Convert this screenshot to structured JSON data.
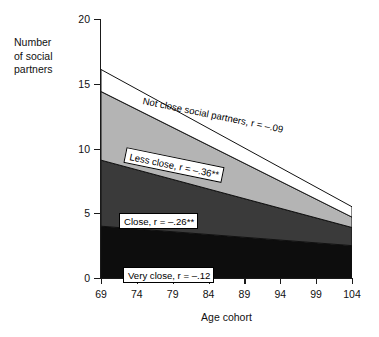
{
  "chart_data": {
    "type": "area",
    "title": "",
    "xlabel": "Age cohort",
    "ylabel": "Number of social partners",
    "ylabel_lines": [
      "Number",
      "of social",
      "partners"
    ],
    "x": [
      69,
      104
    ],
    "xticks": [
      69,
      74,
      79,
      84,
      89,
      94,
      99,
      104
    ],
    "yticks": [
      0,
      5,
      10,
      15,
      20
    ],
    "xlim": [
      69,
      104
    ],
    "ylim": [
      0,
      20
    ],
    "grid": false,
    "legend_position": "inline-annotations",
    "stacked": true,
    "series": [
      {
        "name": "Very close",
        "annotation": "Very close, r = –.12",
        "correlation": "r = –.12",
        "color": "#0d0d0d",
        "values": [
          4.0,
          2.5
        ]
      },
      {
        "name": "Close",
        "annotation": "Close, r = –.26**",
        "correlation": "r = –.26**",
        "color": "#3a3a3a",
        "values": [
          5.1,
          1.4
        ]
      },
      {
        "name": "Less close",
        "annotation": "Less close, r = –.36**",
        "correlation": "r = –.36**",
        "color": "#b4b4b4",
        "values": [
          5.3,
          0.8
        ]
      },
      {
        "name": "Not close social partners",
        "annotation": "Not close social partners, r = –.09",
        "correlation": "r = –.09",
        "color": "#ffffff",
        "values": [
          1.7,
          0.8
        ]
      }
    ],
    "cumulative_tops": {
      "very_close": [
        4.0,
        2.5
      ],
      "close": [
        9.1,
        3.9
      ],
      "less_close": [
        14.4,
        4.7
      ],
      "not_close": [
        16.1,
        5.5
      ]
    }
  },
  "axis": {
    "ytick_labels": [
      "20",
      "15",
      "10",
      "5",
      "0"
    ],
    "xtick_labels": [
      "69",
      "74",
      "79",
      "84",
      "89",
      "94",
      "99",
      "104"
    ],
    "xaxis_title": "Age cohort",
    "yaxis_title_l1": "Number",
    "yaxis_title_l2": "of social",
    "yaxis_title_l3": "partners"
  },
  "annotations": {
    "not_close": "Not close social partners, r = –.09",
    "less_close": "Less close, r = –.36**",
    "close": "Close, r = –.26**",
    "very_close": "Very close, r = –.12"
  },
  "colors": {
    "very_close": "#0d0d0d",
    "close": "#3a3a3a",
    "less_close": "#b4b4b4",
    "not_close": "#ffffff",
    "axis": "#1a1a1a",
    "background": "#ffffff"
  }
}
